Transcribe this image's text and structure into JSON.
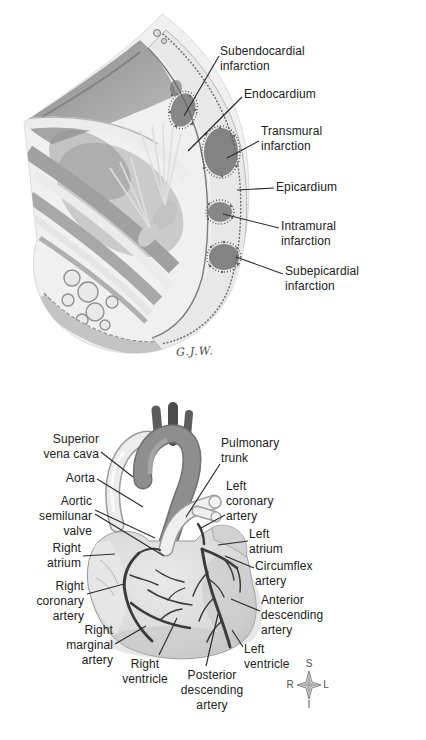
{
  "fig1": {
    "signature": "G.J.W.",
    "labels": {
      "subendocardial": {
        "l1": "Subendocardial",
        "l2": "infarction"
      },
      "endocardium": {
        "l1": "Endocardium"
      },
      "transmural": {
        "l1": "Transmural",
        "l2": "infarction"
      },
      "epicardium": {
        "l1": "Epicardium"
      },
      "intramural": {
        "l1": "Intramural",
        "l2": "infarction"
      },
      "subepicardial": {
        "l1": "Subepicardial",
        "l2": "infarction"
      }
    }
  },
  "fig2": {
    "labels": {
      "superior_vena_cava": {
        "l1": "Superior",
        "l2": "vena cava"
      },
      "aorta": {
        "l1": "Aorta"
      },
      "aortic_semilunar_valve": {
        "l1": "Aortic",
        "l2": "semilunar",
        "l3": "valve"
      },
      "right_atrium": {
        "l1": "Right",
        "l2": "atrium"
      },
      "right_coronary_artery": {
        "l1": "Right",
        "l2": "coronary",
        "l3": "artery"
      },
      "right_marginal_artery": {
        "l1": "Right",
        "l2": "marginal",
        "l3": "artery"
      },
      "right_ventricle": {
        "l1": "Right",
        "l2": "ventricle"
      },
      "pulmonary_trunk": {
        "l1": "Pulmonary",
        "l2": "trunk"
      },
      "left_coronary_artery": {
        "l1": "Left",
        "l2": "coronary",
        "l3": "artery"
      },
      "left_atrium": {
        "l1": "Left",
        "l2": "atrium"
      },
      "circumflex_artery": {
        "l1": "Circumflex",
        "l2": "artery"
      },
      "anterior_descending_artery": {
        "l1": "Anterior",
        "l2": "descending",
        "l3": "artery"
      },
      "left_ventricle": {
        "l1": "Left",
        "l2": "ventricle"
      },
      "posterior_descending_artery": {
        "l1": "Posterior",
        "l2": "descending",
        "l3": "artery"
      }
    },
    "compass": {
      "top": "S",
      "bottom": "I",
      "left": "R",
      "right": "L"
    }
  },
  "colors": {
    "background": "#ffffff",
    "label_text": "#212121",
    "leader_line": "#2b2b2b",
    "aorta_gray": "#8e8e8e",
    "heart_light": "#dcdcdc",
    "artery_dark": "#3b3b3b",
    "infarct_dark": "#666666"
  }
}
